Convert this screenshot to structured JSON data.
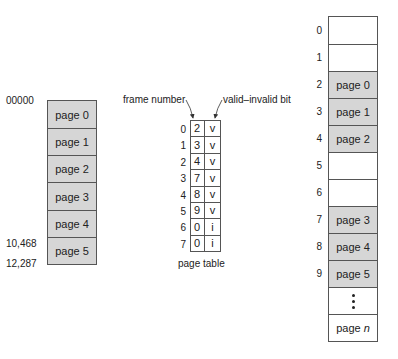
{
  "logical_memory": {
    "start_address": "00000",
    "addresses": [
      "10,468",
      "12,287"
    ],
    "pages": [
      "page 0",
      "page 1",
      "page 2",
      "page 3",
      "page 4",
      "page 5"
    ]
  },
  "page_table": {
    "caption": "page table",
    "frame_number_label": "frame number",
    "valid_bit_label": "valid–invalid bit",
    "rows": [
      {
        "index": "0",
        "frame": "2",
        "bit": "v"
      },
      {
        "index": "1",
        "frame": "3",
        "bit": "v"
      },
      {
        "index": "2",
        "frame": "4",
        "bit": "v"
      },
      {
        "index": "3",
        "frame": "7",
        "bit": "v"
      },
      {
        "index": "4",
        "frame": "8",
        "bit": "v"
      },
      {
        "index": "5",
        "frame": "9",
        "bit": "v"
      },
      {
        "index": "6",
        "frame": "0",
        "bit": "i"
      },
      {
        "index": "7",
        "frame": "0",
        "bit": "i"
      }
    ]
  },
  "physical_memory": {
    "frames": [
      {
        "index": "0",
        "content": ""
      },
      {
        "index": "1",
        "content": ""
      },
      {
        "index": "2",
        "content": "page 0"
      },
      {
        "index": "3",
        "content": "page 1"
      },
      {
        "index": "4",
        "content": "page 2"
      },
      {
        "index": "5",
        "content": ""
      },
      {
        "index": "6",
        "content": ""
      },
      {
        "index": "7",
        "content": "page 3"
      },
      {
        "index": "8",
        "content": "page 4"
      },
      {
        "index": "9",
        "content": "page 5"
      },
      {
        "index": "",
        "content": "ellipsis"
      },
      {
        "index": "",
        "content_prefix": "page ",
        "content_var": "n"
      }
    ]
  },
  "colors": {
    "filled": "#d6d6d6",
    "empty": "#ffffff",
    "border": "#555555"
  }
}
